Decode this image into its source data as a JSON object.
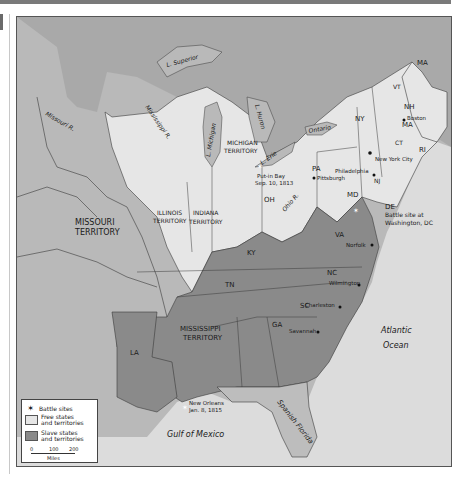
{
  "map": {
    "colors": {
      "free": "#e6e6e6",
      "slave": "#8a8a8a",
      "territory_other": "#b9b9b9",
      "water": "#dcdcdc",
      "canada": "#a9a9a9",
      "spanish_florida": "#bdbdbd",
      "border": "#3a3a3a"
    },
    "regions": {
      "missouri_territory": "MISSOURI\nTERRITORY",
      "missouri_territory_l1": "MISSOURI",
      "missouri_territory_l2": "TERRITORY",
      "illinois_l1": "ILLINOIS",
      "illinois_l2": "TERRITORY",
      "indiana_l1": "INDIANA",
      "indiana_l2": "TERRITORY",
      "michigan_l1": "MICHIGAN",
      "michigan_l2": "TERRITORY",
      "mississippi_l1": "MISSISSIPPI",
      "mississippi_l2": "TERRITORY",
      "oh": "OH",
      "pa": "PA",
      "ny": "NY",
      "vt": "VT",
      "nh": "NH",
      "ma_north": "MA",
      "ma": "MA",
      "ct": "CT",
      "ri": "RI",
      "nj": "NJ",
      "md": "MD",
      "de": "DE",
      "va": "VA",
      "ky": "KY",
      "tn": "TN",
      "nc": "NC",
      "sc": "SC",
      "ga": "GA",
      "la": "LA",
      "spanish_florida": "Spanish Florida"
    },
    "water_labels": {
      "superior": "L. Superior",
      "michigan": "L. Michigan",
      "huron": "L. Huron",
      "erie": "L. Erie",
      "ontario": "Ontario",
      "mississippi_r": "Mississippi R.",
      "missouri_r": "Missouri R.",
      "ohio_r": "Ohio R.",
      "atlantic_l1": "Atlantic",
      "atlantic_l2": "Ocean",
      "gulf": "Gulf of Mexico"
    },
    "cities": {
      "boston": "Boston",
      "nyc": "New York City",
      "philadelphia": "Philadelphia",
      "pittsburgh": "Pittsburgh",
      "norfolk": "Norfolk",
      "wilmington": "Wilmington",
      "charleston": "Charleston",
      "savannah": "Savannah"
    },
    "battles": {
      "put_in_bay_l1": "Put-in Bay",
      "put_in_bay_l2": "Sep. 10, 1813",
      "washington_l1": "Battle site at",
      "washington_l2": "Washington, DC",
      "new_orleans_l1": "New Orleans",
      "new_orleans_l2": "Jan. 8, 1815"
    }
  },
  "legend": {
    "battle_sites": "Battle sites",
    "free_l1": "Free states",
    "free_l2": "and territories",
    "slave_l1": "Slave states",
    "slave_l2": "and territories",
    "scale_ticks": [
      "0",
      "100",
      "200"
    ],
    "scale_unit": "Miles"
  }
}
